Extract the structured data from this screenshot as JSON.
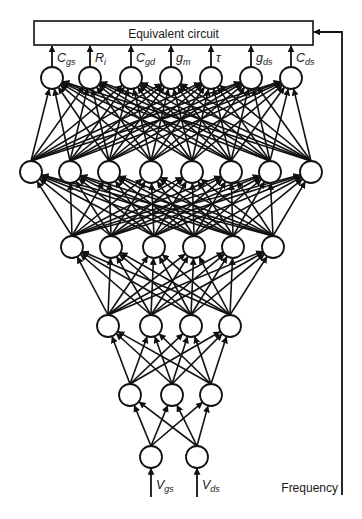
{
  "diagram": {
    "title": "Equivalent circuit",
    "box": {
      "x": 34,
      "y": 21,
      "w": 279,
      "h": 24
    },
    "outputs": [
      {
        "main": "C",
        "sub": "gs"
      },
      {
        "main": "R",
        "sub": "i"
      },
      {
        "main": "C",
        "sub": "gd"
      },
      {
        "main": "g",
        "sub": "m"
      },
      {
        "main": "τ",
        "sub": ""
      },
      {
        "main": "g",
        "sub": "ds"
      },
      {
        "main": "C",
        "sub": "ds"
      }
    ],
    "inputs": [
      {
        "main": "V",
        "sub": "gs"
      },
      {
        "main": "V",
        "sub": "ds"
      }
    ],
    "side_input": "Frequency",
    "node_radius": 11,
    "layers": [
      {
        "name": "output",
        "y": 78,
        "x": [
          52,
          90,
          131,
          171,
          211,
          251,
          291
        ]
      },
      {
        "name": "hidden-1",
        "y": 172,
        "x": [
          31,
          70,
          109,
          151,
          192,
          231,
          270,
          311
        ]
      },
      {
        "name": "hidden-2",
        "y": 247,
        "x": [
          72,
          111,
          154,
          194,
          233,
          273
        ]
      },
      {
        "name": "hidden-3",
        "y": 326,
        "x": [
          108,
          151,
          191,
          230
        ]
      },
      {
        "name": "hidden-4",
        "y": 395,
        "x": [
          130,
          172,
          211
        ]
      },
      {
        "name": "input",
        "y": 457,
        "x": [
          151,
          197
        ]
      }
    ],
    "layer_sizes": [
      2,
      3,
      4,
      6,
      8,
      7
    ],
    "colors": {
      "stroke": "#111111",
      "fill": "#ffffff",
      "text": "#1a1a1a"
    }
  }
}
